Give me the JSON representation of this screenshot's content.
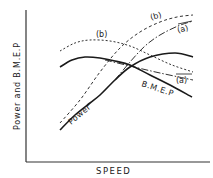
{
  "chart_data": {
    "type": "line",
    "title": "",
    "xlabel": "SPEED",
    "ylabel": "Power and B.M.E.P",
    "grid": false,
    "legend": "inline labels",
    "axis_ticks": "none",
    "series": [
      {
        "name": "B.M.E.P",
        "style": "solid",
        "label": "B.M.E.P",
        "points": [
          [
            60,
            67
          ],
          [
            72,
            60
          ],
          [
            85,
            57
          ],
          [
            100,
            58
          ],
          [
            115,
            61
          ],
          [
            130,
            65
          ],
          [
            150,
            75
          ],
          [
            170,
            85
          ],
          [
            192,
            97
          ]
        ]
      },
      {
        "name": "Power",
        "style": "solid",
        "label": "Power",
        "points": [
          [
            60,
            130
          ],
          [
            75,
            115
          ],
          [
            90,
            103
          ],
          [
            100,
            95
          ],
          [
            115,
            80
          ],
          [
            130,
            67
          ],
          [
            150,
            57
          ],
          [
            175,
            53
          ],
          [
            193,
            57
          ]
        ]
      },
      {
        "name": "B.M.E.P (b)",
        "style": "dashed",
        "label": "(b)",
        "points": [
          [
            60,
            51
          ],
          [
            75,
            43
          ],
          [
            90,
            40
          ],
          [
            110,
            41
          ],
          [
            130,
            46
          ],
          [
            150,
            55
          ],
          [
            172,
            65
          ],
          [
            193,
            72
          ]
        ]
      },
      {
        "name": "B.M.E.P (a)",
        "style": "dash-dot",
        "label": "(a)",
        "points": [
          [
            105,
            60
          ],
          [
            130,
            66
          ],
          [
            160,
            73
          ],
          [
            193,
            80
          ]
        ]
      },
      {
        "name": "Power (b)",
        "style": "dashed",
        "label": "(b)",
        "points": [
          [
            60,
            123
          ],
          [
            80,
            100
          ],
          [
            100,
            72
          ],
          [
            120,
            48
          ],
          [
            140,
            32
          ],
          [
            160,
            22
          ],
          [
            177,
            17
          ],
          [
            193,
            15
          ]
        ]
      },
      {
        "name": "Power (a)",
        "style": "dash-dot",
        "label": "(a)",
        "points": [
          [
            115,
            80
          ],
          [
            130,
            62
          ],
          [
            145,
            46
          ],
          [
            160,
            35
          ],
          [
            178,
            26
          ],
          [
            193,
            21
          ]
        ]
      }
    ]
  },
  "labels": {
    "ylabel": "Power and B.M.E.P",
    "xlabel": "SPEED",
    "bmep": "B.M.E.P",
    "power": "Power",
    "b_bmep": "(b)",
    "b_power": "(b)",
    "a_power": "(a)",
    "a_bmep": "(a)"
  },
  "colors": {
    "ink": "#1a1a1a",
    "background": "#ffffff"
  }
}
